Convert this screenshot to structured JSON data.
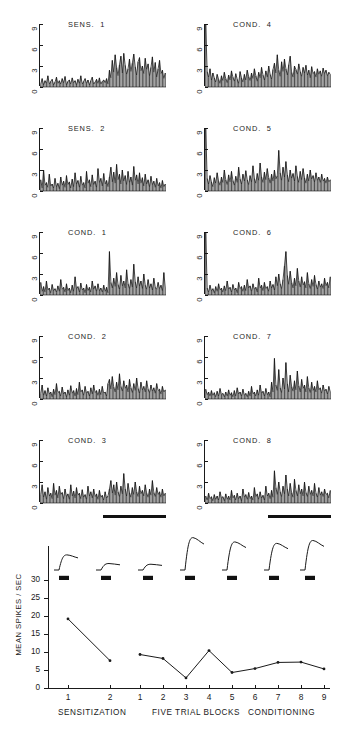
{
  "figure": {
    "type": "neuroscience-psth-figure",
    "background": "#ffffff",
    "ink": "#1a1a1a"
  },
  "psth": {
    "y_ticks": [
      "0",
      "3",
      "6",
      "9"
    ],
    "y_min": 0,
    "y_max": 9,
    "n_bins": 88,
    "panels": [
      {
        "id": "sens-1",
        "title": "SENS.  1",
        "column": "left",
        "row": 0,
        "stim_bar": false,
        "bins": [
          0.4,
          1.2,
          0.3,
          0.9,
          0.5,
          1.6,
          0.4,
          0.8,
          1.1,
          0.3,
          0.7,
          1.4,
          0.5,
          0.9,
          0.4,
          1.2,
          0.6,
          1.5,
          0.3,
          0.8,
          1.0,
          0.4,
          1.3,
          0.6,
          0.9,
          0.3,
          1.1,
          0.5,
          1.6,
          0.4,
          0.8,
          1.2,
          0.5,
          1.0,
          0.3,
          0.9,
          1.4,
          0.4,
          0.7,
          1.1,
          0.5,
          1.3,
          0.4,
          0.8,
          1.0,
          0.6,
          1.2,
          0.4,
          2.4,
          1.3,
          3.8,
          2.1,
          4.6,
          2.8,
          1.6,
          3.2,
          4.4,
          2.0,
          4.8,
          3.1,
          1.8,
          2.6,
          4.0,
          2.2,
          3.4,
          4.7,
          2.9,
          1.7,
          3.6,
          4.2,
          2.3,
          3.0,
          1.9,
          4.1,
          2.5,
          3.3,
          1.6,
          2.8,
          4.3,
          2.1,
          3.5,
          1.4,
          2.6,
          3.8,
          1.9,
          2.4,
          1.2,
          2.0
        ]
      },
      {
        "id": "cond-4",
        "title": "COND.  4",
        "column": "right",
        "row": 0,
        "stim_bar": false,
        "bins": [
          9.0,
          2.2,
          1.4,
          2.6,
          1.0,
          2.0,
          1.3,
          0.7,
          1.8,
          1.1,
          0.5,
          1.6,
          0.9,
          2.1,
          1.2,
          0.6,
          1.7,
          1.0,
          2.3,
          1.4,
          0.8,
          1.9,
          1.1,
          0.5,
          2.2,
          1.3,
          0.7,
          1.8,
          1.0,
          2.4,
          1.5,
          0.9,
          2.0,
          1.2,
          2.6,
          1.6,
          0.8,
          2.1,
          1.3,
          2.8,
          1.7,
          1.0,
          2.3,
          1.4,
          3.0,
          1.8,
          1.1,
          2.5,
          3.4,
          2.0,
          4.6,
          2.4,
          1.5,
          3.6,
          2.2,
          4.0,
          2.6,
          1.7,
          3.2,
          4.4,
          2.1,
          1.4,
          3.0,
          2.5,
          1.8,
          3.3,
          2.2,
          1.5,
          2.8,
          2.0,
          3.1,
          1.7,
          2.4,
          1.3,
          2.9,
          1.9,
          2.2,
          1.4,
          2.6,
          1.8,
          2.3,
          1.5,
          2.7,
          1.9,
          2.4,
          1.6,
          2.1,
          1.8
        ]
      },
      {
        "id": "sens-2",
        "title": "SENS.  2",
        "column": "left",
        "row": 1,
        "stim_bar": false,
        "bins": [
          1.6,
          0.4,
          3.0,
          0.8,
          1.2,
          0.5,
          2.4,
          0.7,
          1.0,
          0.4,
          1.8,
          0.6,
          1.1,
          0.3,
          2.0,
          0.8,
          1.4,
          0.5,
          2.2,
          0.9,
          1.3,
          0.4,
          1.7,
          0.6,
          2.6,
          1.0,
          1.5,
          0.5,
          2.1,
          0.8,
          1.2,
          0.4,
          2.8,
          1.1,
          1.6,
          0.6,
          2.3,
          0.9,
          1.4,
          0.5,
          3.2,
          1.2,
          1.8,
          0.7,
          2.5,
          1.0,
          1.5,
          0.6,
          2.0,
          3.4,
          1.3,
          2.7,
          1.1,
          3.8,
          1.6,
          2.4,
          1.0,
          3.0,
          1.4,
          2.2,
          0.9,
          2.8,
          1.2,
          2.0,
          0.8,
          3.5,
          1.5,
          2.3,
          1.0,
          2.6,
          1.1,
          1.9,
          0.7,
          2.4,
          1.0,
          1.6,
          0.6,
          2.1,
          0.9,
          1.4,
          0.5,
          1.8,
          0.7,
          1.2,
          0.4,
          1.5,
          0.6,
          1.0
        ]
      },
      {
        "id": "cond-5",
        "title": "COND.  5",
        "column": "right",
        "row": 1,
        "stim_bar": false,
        "bins": [
          9.0,
          1.8,
          1.0,
          2.2,
          1.3,
          0.6,
          1.9,
          1.1,
          2.6,
          1.4,
          0.8,
          2.0,
          1.2,
          3.0,
          1.6,
          0.9,
          2.3,
          1.3,
          2.8,
          1.5,
          0.8,
          2.1,
          1.2,
          3.4,
          1.7,
          1.0,
          2.4,
          1.4,
          2.9,
          1.6,
          0.9,
          2.2,
          1.3,
          3.6,
          1.8,
          1.1,
          2.5,
          1.5,
          4.0,
          2.0,
          1.2,
          2.7,
          1.6,
          3.2,
          1.9,
          1.1,
          2.4,
          1.4,
          3.0,
          1.7,
          2.2,
          5.8,
          2.6,
          1.5,
          3.4,
          2.0,
          4.2,
          2.3,
          1.3,
          3.0,
          1.8,
          2.5,
          1.4,
          3.6,
          2.1,
          1.2,
          2.8,
          1.6,
          3.2,
          1.9,
          1.1,
          2.4,
          1.4,
          3.0,
          1.7,
          2.2,
          1.3,
          2.6,
          1.5,
          2.0,
          1.2,
          2.4,
          1.4,
          1.8,
          1.1,
          2.0,
          1.3,
          1.6
        ]
      },
      {
        "id": "cond-1",
        "title": "COND.  1",
        "column": "left",
        "row": 2,
        "stim_bar": false,
        "bins": [
          1.8,
          0.5,
          1.2,
          0.4,
          2.0,
          0.7,
          1.0,
          0.3,
          1.5,
          0.6,
          0.9,
          0.4,
          1.3,
          0.5,
          2.2,
          0.8,
          1.1,
          0.4,
          1.6,
          0.6,
          1.0,
          0.3,
          1.4,
          0.5,
          2.6,
          0.9,
          1.2,
          0.4,
          1.7,
          0.7,
          1.0,
          0.3,
          1.5,
          0.6,
          1.1,
          0.4,
          2.0,
          0.8,
          1.3,
          0.5,
          1.6,
          0.6,
          1.0,
          0.4,
          1.4,
          0.5,
          1.1,
          0.3,
          6.2,
          1.8,
          1.0,
          2.4,
          1.2,
          3.2,
          1.5,
          0.8,
          2.8,
          1.3,
          2.0,
          1.0,
          3.6,
          1.6,
          0.9,
          2.2,
          1.1,
          4.4,
          1.9,
          1.0,
          2.6,
          1.3,
          2.0,
          0.9,
          3.0,
          1.4,
          0.8,
          2.2,
          1.0,
          1.6,
          0.7,
          2.4,
          1.1,
          0.8,
          1.8,
          0.9,
          1.4,
          0.6,
          3.2,
          1.0
        ]
      },
      {
        "id": "cond-6",
        "title": "COND.  6",
        "column": "right",
        "row": 2,
        "stim_bar": false,
        "bins": [
          9.0,
          1.0,
          0.4,
          1.4,
          0.6,
          0.9,
          0.3,
          1.2,
          0.5,
          1.6,
          0.7,
          1.0,
          0.4,
          1.3,
          0.6,
          2.0,
          0.8,
          1.1,
          0.4,
          1.5,
          0.7,
          1.0,
          0.3,
          1.8,
          0.9,
          1.2,
          0.5,
          1.4,
          0.6,
          2.2,
          1.0,
          1.3,
          0.5,
          1.6,
          0.8,
          1.1,
          0.4,
          2.4,
          1.0,
          1.4,
          0.6,
          1.8,
          0.9,
          1.2,
          0.5,
          2.0,
          1.0,
          1.5,
          0.7,
          2.6,
          1.3,
          3.0,
          1.6,
          0.9,
          2.2,
          4.2,
          6.2,
          2.8,
          1.5,
          3.4,
          1.8,
          1.0,
          2.4,
          1.3,
          3.8,
          2.0,
          1.1,
          2.6,
          1.4,
          1.9,
          1.0,
          3.2,
          1.6,
          0.9,
          2.2,
          1.2,
          2.8,
          1.5,
          0.8,
          2.0,
          1.1,
          1.6,
          0.9,
          2.4,
          1.3,
          1.8,
          1.0,
          2.6
        ]
      },
      {
        "id": "cond-2",
        "title": "COND.  2",
        "column": "left",
        "row": 3,
        "stim_bar": false,
        "bins": [
          0.8,
          2.0,
          0.5,
          1.2,
          0.4,
          1.6,
          0.7,
          1.0,
          0.3,
          1.4,
          0.6,
          2.2,
          0.9,
          1.1,
          0.4,
          1.7,
          0.7,
          1.0,
          0.3,
          1.3,
          0.5,
          1.9,
          0.8,
          1.2,
          0.4,
          1.5,
          0.6,
          2.4,
          1.0,
          1.3,
          0.5,
          1.8,
          0.8,
          1.1,
          0.4,
          1.6,
          0.7,
          2.0,
          0.9,
          1.2,
          0.5,
          1.4,
          0.6,
          1.8,
          0.8,
          1.0,
          0.4,
          2.2,
          2.8,
          1.4,
          3.2,
          1.7,
          1.0,
          2.4,
          1.3,
          3.6,
          1.8,
          1.1,
          2.6,
          1.5,
          2.0,
          1.0,
          2.8,
          1.6,
          0.9,
          2.2,
          1.2,
          3.0,
          1.5,
          0.8,
          2.4,
          1.3,
          1.8,
          1.0,
          2.6,
          1.4,
          0.9,
          2.0,
          1.1,
          1.6,
          0.8,
          2.2,
          1.2,
          1.4,
          0.7,
          1.8,
          1.0,
          1.3
        ]
      },
      {
        "id": "cond-7",
        "title": "COND.  7",
        "column": "right",
        "row": 3,
        "stim_bar": false,
        "bins": [
          1.4,
          0.6,
          1.0,
          0.4,
          1.2,
          0.5,
          0.9,
          0.3,
          1.1,
          0.4,
          1.5,
          0.6,
          0.8,
          0.3,
          1.0,
          0.4,
          1.3,
          0.5,
          0.9,
          0.3,
          1.2,
          0.4,
          1.6,
          0.7,
          1.0,
          0.4,
          1.4,
          0.5,
          0.8,
          0.3,
          1.1,
          0.4,
          1.8,
          0.7,
          1.0,
          0.4,
          1.3,
          0.5,
          2.0,
          0.8,
          1.1,
          0.4,
          1.5,
          0.6,
          1.0,
          0.3,
          2.4,
          1.0,
          5.8,
          2.0,
          1.2,
          4.2,
          1.6,
          0.9,
          3.0,
          1.4,
          5.2,
          2.2,
          1.0,
          3.4,
          1.8,
          1.1,
          2.6,
          1.3,
          4.0,
          1.9,
          1.0,
          2.8,
          1.5,
          2.0,
          1.0,
          3.2,
          1.6,
          0.9,
          2.4,
          1.2,
          1.8,
          1.0,
          2.6,
          1.3,
          1.6,
          0.8,
          2.0,
          1.1,
          1.4,
          0.7,
          1.8,
          1.0
        ]
      },
      {
        "id": "cond-3",
        "title": "COND.  3",
        "column": "left",
        "row": 4,
        "stim_bar": true,
        "bins": [
          1.2,
          2.6,
          0.8,
          1.6,
          0.5,
          2.2,
          1.0,
          1.4,
          0.6,
          2.8,
          1.1,
          1.8,
          0.7,
          2.4,
          1.2,
          1.5,
          0.6,
          2.0,
          0.9,
          1.3,
          0.5,
          2.6,
          1.0,
          1.7,
          0.7,
          2.2,
          1.1,
          1.4,
          0.6,
          1.9,
          0.8,
          1.2,
          0.5,
          2.4,
          1.0,
          1.6,
          0.7,
          2.0,
          0.9,
          1.3,
          0.5,
          1.8,
          0.8,
          1.1,
          0.4,
          1.6,
          0.7,
          1.0,
          2.0,
          3.2,
          1.4,
          2.6,
          1.1,
          3.0,
          1.6,
          0.9,
          2.4,
          1.3,
          4.2,
          2.0,
          1.0,
          2.8,
          1.5,
          0.8,
          2.2,
          1.2,
          3.0,
          1.6,
          0.9,
          2.4,
          1.3,
          1.8,
          1.0,
          2.6,
          1.4,
          0.8,
          2.0,
          1.1,
          3.2,
          1.5,
          0.9,
          2.2,
          1.2,
          1.6,
          0.8,
          2.0,
          1.0,
          1.4
        ]
      },
      {
        "id": "cond-8",
        "title": "COND.  8",
        "column": "right",
        "row": 4,
        "stim_bar": true,
        "bins": [
          1.0,
          0.4,
          1.4,
          0.6,
          0.9,
          0.3,
          1.2,
          0.5,
          1.0,
          0.4,
          1.6,
          0.7,
          0.9,
          0.3,
          1.3,
          0.5,
          1.0,
          0.4,
          1.8,
          0.7,
          1.1,
          0.4,
          1.4,
          0.6,
          1.0,
          0.3,
          2.0,
          0.8,
          1.2,
          0.5,
          1.5,
          0.6,
          1.0,
          0.4,
          2.2,
          0.9,
          1.3,
          0.5,
          1.6,
          0.7,
          1.1,
          0.4,
          2.4,
          1.0,
          1.4,
          0.6,
          1.8,
          0.8,
          4.6,
          2.2,
          1.2,
          3.0,
          1.6,
          0.9,
          2.4,
          1.3,
          4.0,
          2.0,
          1.0,
          2.8,
          1.5,
          0.8,
          3.4,
          1.8,
          1.0,
          2.6,
          1.3,
          2.0,
          1.0,
          3.0,
          1.5,
          0.9,
          2.4,
          1.2,
          1.8,
          1.0,
          2.8,
          1.4,
          0.8,
          2.2,
          1.1,
          1.6,
          0.9,
          2.0,
          1.2,
          1.4,
          0.7,
          1.8
        ]
      }
    ]
  },
  "chart_data": {
    "type": "line",
    "title": "",
    "xlabel": "FIVE TRIAL BLOCKS",
    "ylabel": "MEAN SPIKES / SEC",
    "ylim": [
      0,
      30
    ],
    "y_ticks": [
      0,
      5,
      10,
      15,
      20,
      25,
      30
    ],
    "grid": false,
    "legend": "none",
    "groups": [
      {
        "name": "SENSITIZATION",
        "x": [
          1,
          2
        ],
        "values": [
          19.2,
          7.6
        ]
      },
      {
        "name": "CONDITIONING",
        "x": [
          1,
          2,
          3,
          4,
          5,
          6,
          7,
          8,
          9
        ],
        "values": [
          9.3,
          8.2,
          2.8,
          10.4,
          4.3,
          5.4,
          7.1,
          7.2,
          5.3
        ]
      }
    ],
    "x_tick_labels": [
      "1",
      "2",
      "1",
      "2",
      "3",
      "4",
      "5",
      "6",
      "7",
      "8",
      "9"
    ],
    "captions": [
      {
        "text": "SENSITIZATION",
        "align": "left"
      },
      {
        "text": "FIVE TRIAL BLOCKS",
        "align": "center"
      },
      {
        "text": "CONDITIONING",
        "align": "right"
      }
    ],
    "behavior_traces": {
      "count": 7,
      "description": "nictitating-membrane response traces",
      "amplitudes": [
        0.42,
        0.18,
        0.16,
        0.9,
        0.78,
        0.74,
        0.82
      ]
    },
    "stimulus_markers": {
      "count": 7,
      "level": 30
    }
  }
}
